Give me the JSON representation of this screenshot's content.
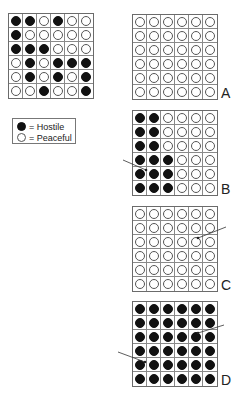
{
  "legend": {
    "items": [
      {
        "symbol": "filled-circle",
        "text": "= Hostile",
        "color": "#111111"
      },
      {
        "symbol": "open-circle",
        "text": "= Peaceful",
        "color": "#ffffff"
      }
    ]
  },
  "grids": {
    "example": {
      "label": "",
      "rows": [
        "BBWBWW",
        "BWWWWW",
        "BBBWWW",
        "WBWBBB",
        "WBWBWB",
        "WWBWWB"
      ]
    },
    "A": {
      "label": "A",
      "rows": [
        "WWWWWW",
        "WWWWWW",
        "WWWWWW",
        "WWWWWW",
        "WWWWWW",
        "WWWWWW"
      ]
    },
    "B": {
      "label": "B",
      "rows": [
        "BBWWWW",
        "BBWWWW",
        "BBWWWW",
        "BBBWWW",
        "BBBWWW",
        "BBBWWW"
      ]
    },
    "C": {
      "label": "C",
      "rows": [
        "WWWWWW",
        "WWWWWW",
        "WWWWWW",
        "WWWWWW",
        "WWWWWW",
        "WWWWWW"
      ]
    },
    "D": {
      "label": "D",
      "rows": [
        "BBBBBB",
        "BBBBBB",
        "BBBBBB",
        "BBBBBB",
        "BBBBBB",
        "BBBBBB"
      ]
    }
  },
  "arrows": [
    {
      "panel": "B",
      "from": [
        123,
        160
      ],
      "to": [
        146,
        170
      ]
    },
    {
      "panel": "C",
      "from": [
        226,
        227
      ],
      "to": [
        198,
        238
      ]
    },
    {
      "panel": "D",
      "from": [
        224,
        325
      ],
      "to": [
        198,
        333
      ]
    },
    {
      "panel": "D",
      "from": [
        118,
        352
      ],
      "to": [
        145,
        362
      ]
    }
  ]
}
